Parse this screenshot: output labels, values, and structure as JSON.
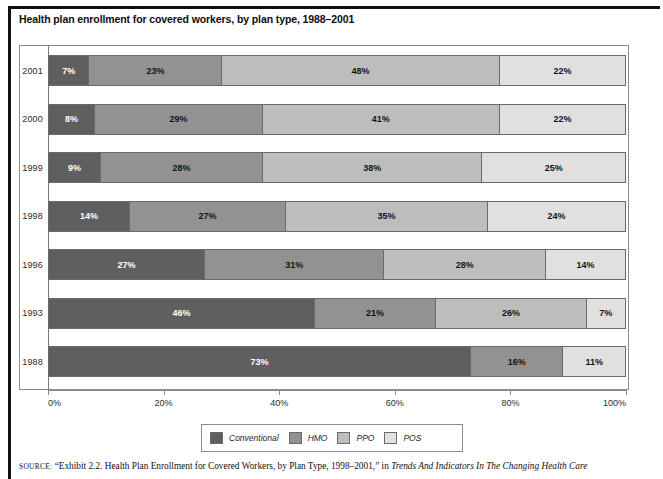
{
  "title": "Health plan enrollment for covered workers, by plan type, 1988–2001",
  "source": {
    "label": "SOURCE:",
    "text_part1": " “Exhibit 2.2. Health Plan Enrollment for Covered Workers, by Plan Type, 1998–2001,” in ",
    "text_italic": "Trends And Indicators In The Changing Health Care"
  },
  "axis": {
    "tick_labels": [
      "0%",
      "20%",
      "40%",
      "60%",
      "80%",
      "100%"
    ],
    "tick_values": [
      0,
      20,
      40,
      60,
      80,
      100
    ],
    "min": 0,
    "max": 100
  },
  "legend": {
    "position": "bottom-center",
    "items": [
      {
        "label": "Conventional",
        "color": "#5f5f5f"
      },
      {
        "label": "HMO",
        "color": "#929292"
      },
      {
        "label": "PPO",
        "color": "#bdbdbd"
      },
      {
        "label": "POS",
        "color": "#e0e0e0"
      }
    ]
  },
  "chart_data": {
    "type": "bar",
    "orientation": "horizontal",
    "stacked": true,
    "stack_total": 100,
    "title": "Health plan enrollment for covered workers, by plan type, 1988–2001",
    "xlabel": "",
    "ylabel": "",
    "xlim": [
      0,
      100
    ],
    "grid": false,
    "legend_position": "bottom-center",
    "categories": [
      "2001",
      "2000",
      "1999",
      "1998",
      "1996",
      "1993",
      "1988"
    ],
    "series": [
      {
        "name": "Conventional",
        "color": "#5f5f5f",
        "values": [
          7,
          8,
          9,
          14,
          27,
          46,
          73
        ]
      },
      {
        "name": "HMO",
        "color": "#929292",
        "values": [
          23,
          29,
          28,
          27,
          31,
          21,
          16
        ]
      },
      {
        "name": "PPO",
        "color": "#bdbdbd",
        "values": [
          48,
          41,
          38,
          35,
          28,
          26,
          0
        ]
      },
      {
        "name": "POS",
        "color": "#e0e0e0",
        "values": [
          22,
          22,
          25,
          24,
          14,
          7,
          11
        ]
      }
    ],
    "rows": [
      {
        "year": "2001",
        "segments": [
          {
            "series": "Conventional",
            "value": 7,
            "label": "7%",
            "color": "#5f5f5f"
          },
          {
            "series": "HMO",
            "value": 23,
            "label": "23%",
            "color": "#929292"
          },
          {
            "series": "PPO",
            "value": 48,
            "label": "48%",
            "color": "#bdbdbd"
          },
          {
            "series": "POS",
            "value": 22,
            "label": "22%",
            "color": "#e0e0e0"
          }
        ]
      },
      {
        "year": "2000",
        "segments": [
          {
            "series": "Conventional",
            "value": 8,
            "label": "8%",
            "color": "#5f5f5f"
          },
          {
            "series": "HMO",
            "value": 29,
            "label": "29%",
            "color": "#929292"
          },
          {
            "series": "PPO",
            "value": 41,
            "label": "41%",
            "color": "#bdbdbd"
          },
          {
            "series": "POS",
            "value": 22,
            "label": "22%",
            "color": "#e0e0e0"
          }
        ]
      },
      {
        "year": "1999",
        "segments": [
          {
            "series": "Conventional",
            "value": 9,
            "label": "9%",
            "color": "#5f5f5f"
          },
          {
            "series": "HMO",
            "value": 28,
            "label": "28%",
            "color": "#929292"
          },
          {
            "series": "PPO",
            "value": 38,
            "label": "38%",
            "color": "#bdbdbd"
          },
          {
            "series": "POS",
            "value": 25,
            "label": "25%",
            "color": "#e0e0e0"
          }
        ]
      },
      {
        "year": "1998",
        "segments": [
          {
            "series": "Conventional",
            "value": 14,
            "label": "14%",
            "color": "#5f5f5f"
          },
          {
            "series": "HMO",
            "value": 27,
            "label": "27%",
            "color": "#929292"
          },
          {
            "series": "PPO",
            "value": 35,
            "label": "35%",
            "color": "#bdbdbd"
          },
          {
            "series": "POS",
            "value": 24,
            "label": "24%",
            "color": "#e0e0e0"
          }
        ]
      },
      {
        "year": "1996",
        "segments": [
          {
            "series": "Conventional",
            "value": 27,
            "label": "27%",
            "color": "#5f5f5f"
          },
          {
            "series": "HMO",
            "value": 31,
            "label": "31%",
            "color": "#929292"
          },
          {
            "series": "PPO",
            "value": 28,
            "label": "28%",
            "color": "#bdbdbd"
          },
          {
            "series": "POS",
            "value": 14,
            "label": "14%",
            "color": "#e0e0e0"
          }
        ]
      },
      {
        "year": "1993",
        "segments": [
          {
            "series": "Conventional",
            "value": 46,
            "label": "46%",
            "color": "#5f5f5f"
          },
          {
            "series": "HMO",
            "value": 21,
            "label": "21%",
            "color": "#929292"
          },
          {
            "series": "PPO",
            "value": 26,
            "label": "26%",
            "color": "#bdbdbd"
          },
          {
            "series": "POS",
            "value": 7,
            "label": "7%",
            "color": "#e0e0e0"
          }
        ]
      },
      {
        "year": "1988",
        "segments": [
          {
            "series": "Conventional",
            "value": 73,
            "label": "73%",
            "color": "#5f5f5f"
          },
          {
            "series": "HMO",
            "value": 16,
            "label": "16%",
            "color": "#929292"
          },
          {
            "series": "POS",
            "value": 11,
            "label": "11%",
            "color": "#e0e0e0"
          }
        ]
      }
    ]
  }
}
